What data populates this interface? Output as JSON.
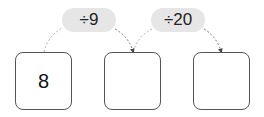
{
  "operations": [
    {
      "label": "÷9"
    },
    {
      "label": "÷20"
    }
  ],
  "boxes": [
    {
      "value": "8"
    },
    {
      "value": ""
    },
    {
      "value": ""
    }
  ],
  "colors": {
    "pill_bg": "#e6e6e6",
    "box_border": "#555555",
    "arrow": "#555555"
  }
}
